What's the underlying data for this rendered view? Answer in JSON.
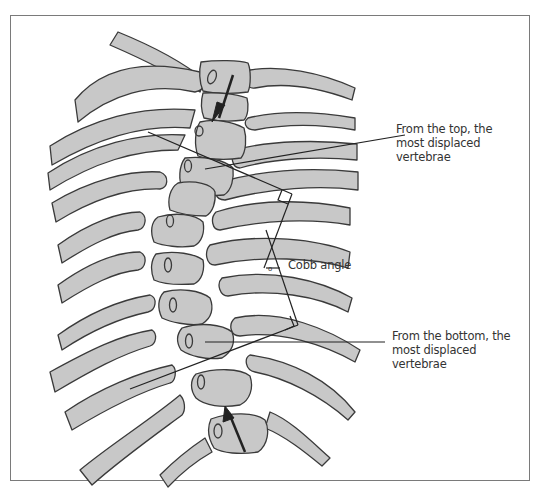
{
  "figure": {
    "colors": {
      "bone_fill": "#c8c8c8",
      "outline": "#3a3a3a",
      "line": "#222222",
      "frame": "#7a7a7a",
      "text": "#333333"
    }
  },
  "labels": {
    "top_vertebra": {
      "line1": "From the top, the",
      "line2": "most displaced",
      "line3": "vertebrae"
    },
    "cobb_angle": "Cobb angle",
    "degree_symbol": "o",
    "bottom_vertebra": {
      "line1": "From the bottom, the",
      "line2": "most displaced",
      "line3": "vertebrae"
    }
  },
  "arrows": {
    "top": {
      "direction": "down",
      "meaning": "displacement from top"
    },
    "bottom": {
      "direction": "up",
      "meaning": "displacement from bottom"
    }
  },
  "icons": {
    "right_angle_marker": "square-corner",
    "arrow": "arrow-icon"
  }
}
